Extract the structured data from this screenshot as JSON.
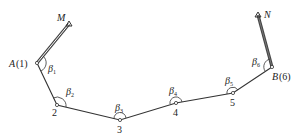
{
  "diagram": {
    "type": "traverse",
    "control_points": [
      {
        "name": "M",
        "x": 69,
        "y": 24
      },
      {
        "name": "N",
        "x": 258,
        "y": 15
      }
    ],
    "stations": [
      {
        "id": "A",
        "label": "A(1)",
        "x": 37,
        "y": 63,
        "angle": "β1",
        "angle_base": "β",
        "angle_sub": "1"
      },
      {
        "id": "2",
        "label": "2",
        "x": 57,
        "y": 105,
        "angle": "β2",
        "angle_base": "β",
        "angle_sub": "2"
      },
      {
        "id": "3",
        "label": "3",
        "x": 120,
        "y": 120,
        "angle": "β3",
        "angle_base": "β",
        "angle_sub": "3"
      },
      {
        "id": "4",
        "label": "4",
        "x": 176,
        "y": 103,
        "angle": "β4",
        "angle_base": "β",
        "angle_sub": "4"
      },
      {
        "id": "5",
        "label": "5",
        "x": 233,
        "y": 93,
        "angle": "β5",
        "angle_base": "β",
        "angle_sub": "5"
      },
      {
        "id": "B",
        "label": "B(6)",
        "x": 272,
        "y": 67,
        "angle": "β6",
        "angle_base": "β",
        "angle_sub": "6"
      }
    ],
    "labels": {
      "M": "M",
      "N": "N",
      "A_letter": "A",
      "A_num": "(1)",
      "B_letter": "B",
      "B_num": "(6)",
      "p2": "2",
      "p3": "3",
      "p4": "4",
      "p5": "5",
      "beta": "β",
      "s1": "1",
      "s2": "2",
      "s3": "3",
      "s4": "4",
      "s5": "5",
      "s6": "6"
    },
    "colors": {
      "line": "#333333",
      "known_line": "#444444"
    }
  }
}
